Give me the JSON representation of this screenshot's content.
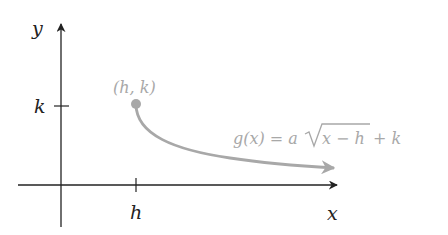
{
  "diagram": {
    "type": "function-graph",
    "axes": {
      "x_label": "x",
      "y_label": "y",
      "x_tick_label": "h",
      "y_tick_label": "k"
    },
    "point": {
      "label": "(h, k)"
    },
    "curve": {
      "label_prefix": "g(x) = a",
      "label_radicand": "x − h",
      "label_suffix": " + k",
      "color": "#a8a8a8"
    },
    "colors": {
      "axes": "#222222",
      "curve": "#a8a8a8",
      "background": "#ffffff"
    }
  }
}
